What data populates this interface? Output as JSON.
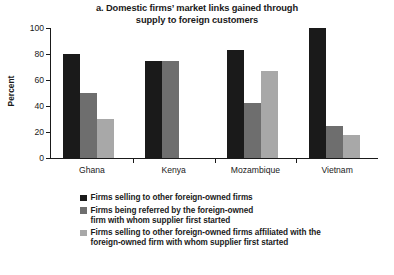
{
  "chart_data": {
    "type": "bar",
    "title": "a. Domestic firms’ market links gained through supply to foreign customers",
    "title_lines": [
      "a. Domestic firms’ market links gained through",
      "supply to foreign customers"
    ],
    "xlabel": "",
    "ylabel": "Percent",
    "ylim": [
      0,
      100
    ],
    "yticks": [
      0,
      20,
      40,
      60,
      80,
      100
    ],
    "grid": false,
    "legend_position": "bottom",
    "categories": [
      "Ghana",
      "Kenya",
      "Mozambique",
      "Vietnam"
    ],
    "series": [
      {
        "name": "Firms selling to other foreign-owned firms",
        "color": "#1a1a1a",
        "values": [
          80,
          75,
          83,
          100
        ]
      },
      {
        "name": "Firms being referred by the foreign-owned firm with whom supplier first started",
        "color": "#6e6e6e",
        "values": [
          50,
          75,
          42,
          25
        ]
      },
      {
        "name": "Firms selling to other foreign-owned firms affiliated with the foreign-owned firm with whom supplier first started",
        "color": "#a8a8a8",
        "values": [
          30,
          0,
          67,
          18
        ]
      }
    ]
  },
  "legend": [
    {
      "color": "#1a1a1a",
      "lines": [
        "Firms selling to other foreign-owned firms"
      ]
    },
    {
      "color": "#6e6e6e",
      "lines": [
        "Firms being referred by the foreign-owned",
        "firm with whom supplier first started"
      ]
    },
    {
      "color": "#a8a8a8",
      "lines": [
        "Firms selling to other foreign-owned firms affiliated with the",
        "foreign-owned firm with whom supplier first started"
      ]
    }
  ]
}
